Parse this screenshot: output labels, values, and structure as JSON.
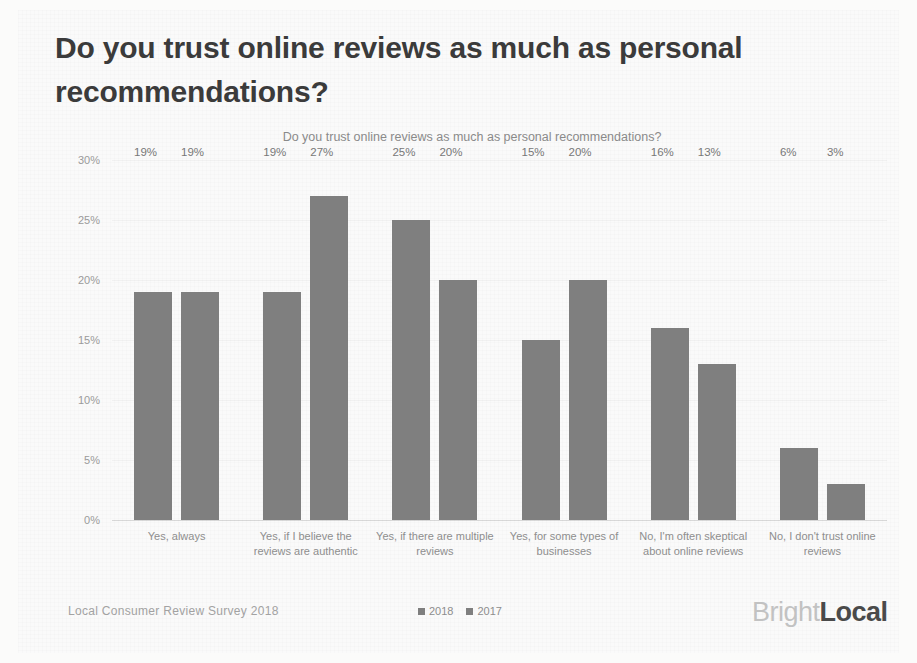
{
  "slide": {
    "title": "Do you trust online reviews as much as personal recommendations?"
  },
  "footer": {
    "source": "Local Consumer Review Survey 2018",
    "logo_light": "Bright",
    "logo_dark": "Local"
  },
  "chart_data": {
    "type": "bar",
    "title": "Do you trust online reviews as much as personal recommendations?",
    "xlabel": "",
    "ylabel": "",
    "ylim": [
      0,
      30
    ],
    "yticks": [
      "0%",
      "5%",
      "10%",
      "15%",
      "20%",
      "25%",
      "30%"
    ],
    "ytick_values": [
      0,
      5,
      10,
      15,
      20,
      25,
      30
    ],
    "grid": true,
    "legend_position": "bottom-center",
    "value_suffix": "%",
    "bar_color": "#7f7f7f",
    "categories": [
      "Yes, always",
      "Yes, if I believe the reviews are authentic",
      "Yes, if there are multiple reviews",
      "Yes, for some types of businesses",
      "No, I'm often skeptical about online reviews",
      "No, I don't trust online reviews"
    ],
    "series": [
      {
        "name": "2018",
        "color": "#7f7f7f",
        "values": [
          19,
          19,
          25,
          15,
          16,
          6
        ],
        "labels": [
          "19%",
          "19%",
          "25%",
          "15%",
          "16%",
          "6%"
        ]
      },
      {
        "name": "2017",
        "color": "#7f7f7f",
        "values": [
          19,
          27,
          20,
          20,
          13,
          3
        ],
        "labels": [
          "19%",
          "27%",
          "20%",
          "20%",
          "13%",
          "3%"
        ]
      }
    ]
  }
}
